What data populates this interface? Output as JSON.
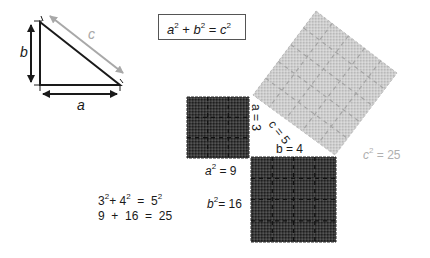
{
  "diagram": {
    "title_formula": {
      "a": "a",
      "plus": "+",
      "b": "b",
      "eq": "=",
      "c": "c",
      "exp": "2"
    },
    "triangle": {
      "label_a": "a",
      "label_b": "b",
      "label_c": "c",
      "vertices": [
        [
          40,
          22
        ],
        [
          40,
          85
        ],
        [
          120,
          85
        ]
      ]
    },
    "squares": [
      {
        "name": "a-squared",
        "label_base": "a",
        "exp": "2",
        "label_eq": "= 9",
        "side_label": "a = 3",
        "fill": "#333333",
        "grid": 3
      },
      {
        "name": "b-squared",
        "label_base": "b",
        "exp": "2",
        "label_eq": "= 16",
        "side_label": "b = 4",
        "fill": "#333333",
        "grid": 4
      },
      {
        "name": "c-squared",
        "label_base": "c",
        "exp": "2",
        "label_eq": "= 25",
        "side_label": "c = 5",
        "fill": "#c8c8c8",
        "grid": 5
      }
    ],
    "equations": {
      "line1": {
        "t1": "3",
        "p": "+",
        "t2": "4",
        "eq": "=",
        "t3": "5",
        "exp": "2"
      },
      "line2": "9  +  16  =  25"
    },
    "colors": {
      "dark_square": "#333333",
      "light_square": "#c6c6c6",
      "c_arrow": "#a8a8a8",
      "c2_label": "#b0b0b0",
      "line": "#1a1a1a"
    }
  }
}
